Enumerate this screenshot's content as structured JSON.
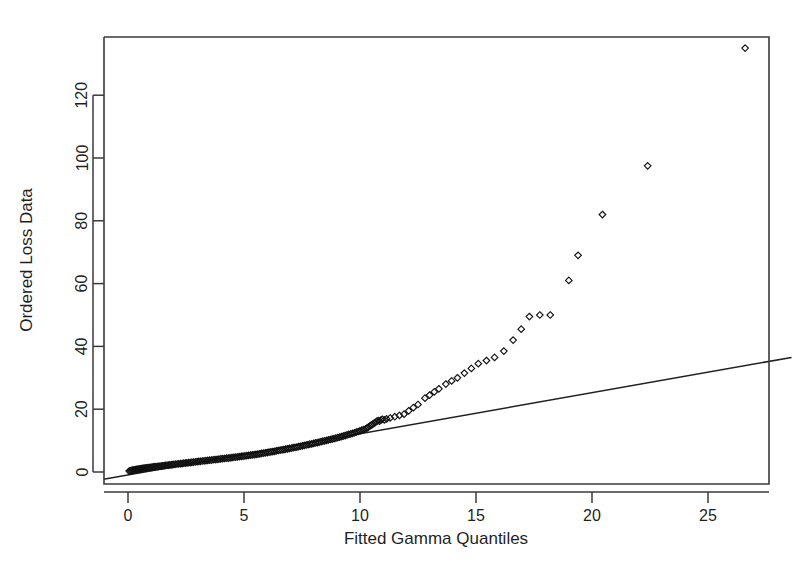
{
  "chart_data": {
    "type": "scatter",
    "title": "",
    "subtitle": "",
    "xlabel": "Fitted Gamma Quantiles",
    "ylabel": "Ordered Loss Data",
    "xlim": [
      -1.05,
      28.6
    ],
    "ylim": [
      -4.0,
      142.0
    ],
    "xticks": [
      0,
      5,
      10,
      15,
      20,
      25
    ],
    "xtick_labels": [
      "0",
      "5",
      "10",
      "15",
      "20",
      "25"
    ],
    "yticks": [
      0,
      20,
      40,
      60,
      80,
      100,
      120
    ],
    "ytick_labels": [
      "0",
      "20",
      "40",
      "60",
      "80",
      "100",
      "120"
    ],
    "grid": false,
    "legend": null,
    "marker": "open-diamond",
    "marker_color": "#111111",
    "line_color": "#202020",
    "background": "#ffffff",
    "annotations": [],
    "series": [
      {
        "name": "Ordered Loss Data vs Fitted Gamma Quantiles",
        "type": "scatter",
        "marker": "open-diamond",
        "points": [
          [
            0.05,
            0.3
          ],
          [
            0.1,
            0.4
          ],
          [
            0.14,
            0.5
          ],
          [
            0.18,
            0.55
          ],
          [
            0.22,
            0.6
          ],
          [
            0.26,
            0.65
          ],
          [
            0.3,
            0.7
          ],
          [
            0.34,
            0.75
          ],
          [
            0.38,
            0.8
          ],
          [
            0.42,
            0.85
          ],
          [
            0.46,
            0.9
          ],
          [
            0.5,
            0.95
          ],
          [
            0.54,
            1.0
          ],
          [
            0.58,
            1.05
          ],
          [
            0.62,
            1.1
          ],
          [
            0.66,
            1.15
          ],
          [
            0.7,
            1.2
          ],
          [
            0.75,
            1.25
          ],
          [
            0.8,
            1.3
          ],
          [
            0.85,
            1.35
          ],
          [
            0.9,
            1.4
          ],
          [
            0.95,
            1.45
          ],
          [
            1.0,
            1.5
          ],
          [
            1.05,
            1.55
          ],
          [
            1.1,
            1.6
          ],
          [
            1.15,
            1.65
          ],
          [
            1.2,
            1.7
          ],
          [
            1.26,
            1.75
          ],
          [
            1.32,
            1.8
          ],
          [
            1.38,
            1.85
          ],
          [
            1.44,
            1.9
          ],
          [
            1.5,
            1.95
          ],
          [
            1.56,
            2.0
          ],
          [
            1.62,
            2.1
          ],
          [
            1.68,
            2.15
          ],
          [
            1.74,
            2.2
          ],
          [
            1.8,
            2.25
          ],
          [
            1.86,
            2.3
          ],
          [
            1.92,
            2.35
          ],
          [
            1.98,
            2.4
          ],
          [
            2.05,
            2.5
          ],
          [
            2.12,
            2.55
          ],
          [
            2.19,
            2.6
          ],
          [
            2.26,
            2.65
          ],
          [
            2.33,
            2.7
          ],
          [
            2.4,
            2.8
          ],
          [
            2.47,
            2.85
          ],
          [
            2.54,
            2.9
          ],
          [
            2.61,
            2.95
          ],
          [
            2.68,
            3.0
          ],
          [
            2.75,
            3.1
          ],
          [
            2.82,
            3.15
          ],
          [
            2.9,
            3.2
          ],
          [
            2.98,
            3.3
          ],
          [
            3.05,
            3.35
          ],
          [
            3.12,
            3.4
          ],
          [
            3.2,
            3.5
          ],
          [
            3.28,
            3.55
          ],
          [
            3.36,
            3.6
          ],
          [
            3.44,
            3.7
          ],
          [
            3.52,
            3.75
          ],
          [
            3.6,
            3.8
          ],
          [
            3.68,
            3.9
          ],
          [
            3.76,
            3.95
          ],
          [
            3.84,
            4.0
          ],
          [
            3.92,
            4.1
          ],
          [
            4.0,
            4.2
          ],
          [
            4.08,
            4.25
          ],
          [
            4.16,
            4.3
          ],
          [
            4.24,
            4.4
          ],
          [
            4.32,
            4.45
          ],
          [
            4.4,
            4.5
          ],
          [
            4.48,
            4.6
          ],
          [
            4.56,
            4.7
          ],
          [
            4.64,
            4.75
          ],
          [
            4.72,
            4.8
          ],
          [
            4.8,
            4.9
          ],
          [
            4.88,
            5.0
          ],
          [
            4.96,
            5.05
          ],
          [
            5.04,
            5.1
          ],
          [
            5.12,
            5.2
          ],
          [
            5.2,
            5.3
          ],
          [
            5.28,
            5.4
          ],
          [
            5.36,
            5.45
          ],
          [
            5.44,
            5.5
          ],
          [
            5.52,
            5.6
          ],
          [
            5.6,
            5.7
          ],
          [
            5.68,
            5.8
          ],
          [
            5.76,
            5.9
          ],
          [
            5.84,
            6.0
          ],
          [
            5.92,
            6.1
          ],
          [
            6.0,
            6.2
          ],
          [
            6.08,
            6.3
          ],
          [
            6.16,
            6.4
          ],
          [
            6.24,
            6.5
          ],
          [
            6.32,
            6.6
          ],
          [
            6.4,
            6.75
          ],
          [
            6.48,
            6.85
          ],
          [
            6.56,
            6.95
          ],
          [
            6.64,
            7.05
          ],
          [
            6.72,
            7.15
          ],
          [
            6.8,
            7.3
          ],
          [
            6.88,
            7.4
          ],
          [
            6.96,
            7.5
          ],
          [
            7.04,
            7.6
          ],
          [
            7.12,
            7.75
          ],
          [
            7.2,
            7.85
          ],
          [
            7.28,
            7.95
          ],
          [
            7.36,
            8.1
          ],
          [
            7.44,
            8.2
          ],
          [
            7.52,
            8.35
          ],
          [
            7.6,
            8.45
          ],
          [
            7.68,
            8.6
          ],
          [
            7.76,
            8.7
          ],
          [
            7.84,
            8.85
          ],
          [
            7.92,
            8.95
          ],
          [
            8.0,
            9.1
          ],
          [
            8.08,
            9.25
          ],
          [
            8.16,
            9.35
          ],
          [
            8.24,
            9.5
          ],
          [
            8.32,
            9.65
          ],
          [
            8.4,
            9.8
          ],
          [
            8.48,
            9.9
          ],
          [
            8.56,
            10.05
          ],
          [
            8.64,
            10.2
          ],
          [
            8.72,
            10.35
          ],
          [
            8.8,
            10.5
          ],
          [
            8.88,
            10.65
          ],
          [
            8.96,
            10.8
          ],
          [
            9.04,
            10.95
          ],
          [
            9.12,
            11.1
          ],
          [
            9.2,
            11.3
          ],
          [
            9.28,
            11.45
          ],
          [
            9.36,
            11.6
          ],
          [
            9.44,
            11.8
          ],
          [
            9.52,
            11.95
          ],
          [
            9.6,
            12.15
          ],
          [
            9.68,
            12.3
          ],
          [
            9.76,
            12.5
          ],
          [
            9.84,
            12.7
          ],
          [
            9.92,
            12.9
          ],
          [
            10.0,
            13.1
          ],
          [
            10.08,
            13.3
          ],
          [
            10.16,
            13.5
          ],
          [
            10.24,
            13.7
          ],
          [
            10.3,
            14.0
          ],
          [
            10.36,
            14.3
          ],
          [
            10.42,
            14.6
          ],
          [
            10.48,
            14.9
          ],
          [
            10.54,
            15.2
          ],
          [
            10.6,
            15.5
          ],
          [
            10.66,
            15.8
          ],
          [
            10.72,
            16.1
          ],
          [
            10.78,
            16.4
          ],
          [
            10.84,
            16.2
          ],
          [
            10.9,
            16.5
          ],
          [
            10.96,
            16.8
          ],
          [
            11.05,
            16.6
          ],
          [
            11.15,
            16.9
          ],
          [
            11.3,
            17.2
          ],
          [
            11.5,
            17.6
          ],
          [
            11.7,
            18.0
          ],
          [
            11.9,
            18.4
          ],
          [
            12.1,
            19.5
          ],
          [
            12.3,
            20.5
          ],
          [
            12.5,
            21.5
          ],
          [
            12.8,
            23.5
          ],
          [
            13.0,
            24.5
          ],
          [
            13.2,
            25.5
          ],
          [
            13.4,
            26.5
          ],
          [
            13.7,
            28.0
          ],
          [
            13.95,
            29.0
          ],
          [
            14.2,
            30.0
          ],
          [
            14.5,
            31.5
          ],
          [
            14.8,
            33.0
          ],
          [
            15.1,
            34.5
          ],
          [
            15.45,
            35.5
          ],
          [
            15.8,
            36.5
          ],
          [
            16.2,
            38.5
          ],
          [
            16.6,
            42.0
          ],
          [
            16.95,
            45.5
          ],
          [
            17.3,
            49.5
          ],
          [
            17.75,
            50.0
          ],
          [
            18.2,
            50.0
          ],
          [
            19.0,
            61.0
          ],
          [
            19.4,
            69.0
          ],
          [
            20.45,
            82.0
          ],
          [
            22.4,
            97.5
          ],
          [
            26.6,
            135.0
          ]
        ]
      },
      {
        "name": "reference line",
        "type": "line",
        "endpoints": [
          [
            -1.05,
            -2.3
          ],
          [
            28.6,
            36.5
          ]
        ]
      }
    ]
  }
}
